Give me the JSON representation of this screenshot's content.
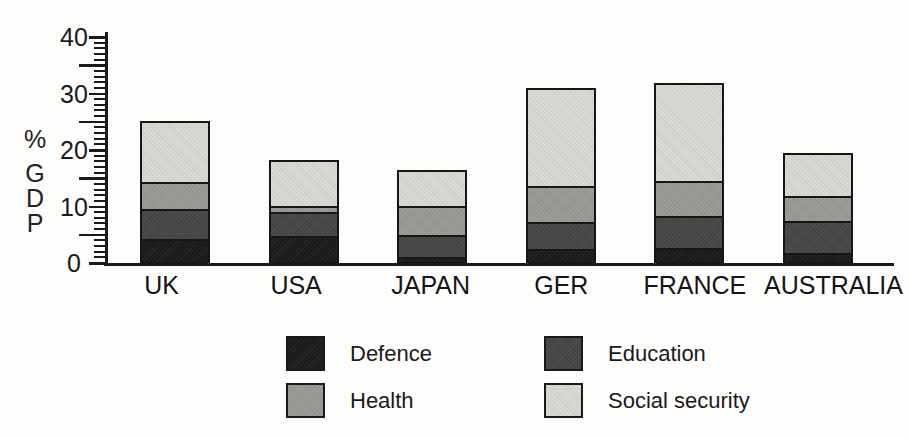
{
  "chart_data": {
    "type": "bar",
    "stacked": true,
    "title": "",
    "xlabel": "",
    "ylabel": "% GDP",
    "ylim": [
      0,
      40
    ],
    "yticks_major": [
      0,
      10,
      20,
      30,
      40
    ],
    "ytick_medium_step": 5,
    "ytick_minor_step": 1,
    "grid": false,
    "legend_position": "bottom",
    "categories": [
      "UK",
      "USA",
      "JAPAN",
      "GER",
      "FRANCE",
      "AUSTRALIA"
    ],
    "series": [
      {
        "name": "Defence",
        "color": "#1b1b1b",
        "values": [
          4.2,
          4.6,
          1.0,
          2.3,
          2.6,
          1.7
        ]
      },
      {
        "name": "Education",
        "color": "#464644",
        "values": [
          5.2,
          4.4,
          3.9,
          4.8,
          5.6,
          5.6
        ]
      },
      {
        "name": "Health",
        "color": "#999996",
        "values": [
          4.9,
          1.0,
          5.1,
          6.4,
          6.2,
          4.4
        ]
      },
      {
        "name": "Social security",
        "color": "#d9d9d4",
        "values": [
          10.4,
          7.7,
          6.0,
          17.1,
          17.1,
          7.4
        ]
      }
    ]
  }
}
